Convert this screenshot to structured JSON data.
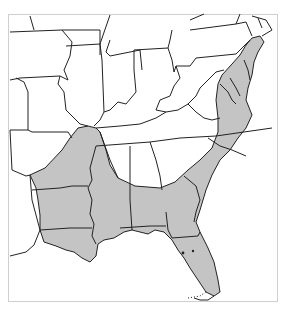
{
  "map": {
    "title": "",
    "region": "Eastern United States",
    "background_color": "#ffffff",
    "frame_color": "#cfcfcf",
    "outline_color": "#222222",
    "range_fill_color": "#c4c4c4",
    "shaded_states": [
      "Arkansas (southeast)",
      "Louisiana",
      "Mississippi",
      "Alabama",
      "Georgia",
      "Florida",
      "South Carolina",
      "North Carolina (east)",
      "Virginia (east)",
      "Maryland (east)",
      "Delaware",
      "New Jersey (south)",
      "Tennessee (west tip)",
      "Kentucky (west tip)",
      "Missouri (bootheel)"
    ],
    "legend": []
  }
}
